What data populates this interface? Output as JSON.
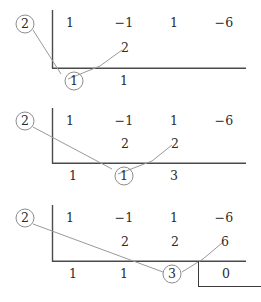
{
  "figure": {
    "divisor": "2",
    "dividend_coefficients": [
      "1",
      "−1",
      "1",
      "−6"
    ],
    "line_color": "#4a4a4a",
    "connector_color": "#9a9a9a",
    "circle_color": "#8c8c8c",
    "text_color": "#2b2b2b"
  },
  "panels": [
    {
      "id": "step-1",
      "divisor": "2",
      "top_row": [
        "1",
        "−1",
        "1",
        "−6"
      ],
      "middle_row": [
        "2"
      ],
      "bottom_row": [
        "1"
      ],
      "circled_results": [
        "1"
      ],
      "boxed_remainder": null
    },
    {
      "id": "step-2",
      "divisor": "2",
      "top_row": [
        "1",
        "−1",
        "1",
        "−6"
      ],
      "middle_row": [
        "2",
        "2"
      ],
      "bottom_row": [
        "1",
        "3"
      ],
      "circled_results": [
        "1"
      ],
      "boxed_remainder": null
    },
    {
      "id": "step-3",
      "divisor": "2",
      "top_row": [
        "1",
        "−1",
        "1",
        "−6"
      ],
      "middle_row": [
        "2",
        "2",
        "6"
      ],
      "bottom_row": [
        "1",
        "1"
      ],
      "circled_results": [
        "3"
      ],
      "boxed_remainder": "0"
    }
  ]
}
